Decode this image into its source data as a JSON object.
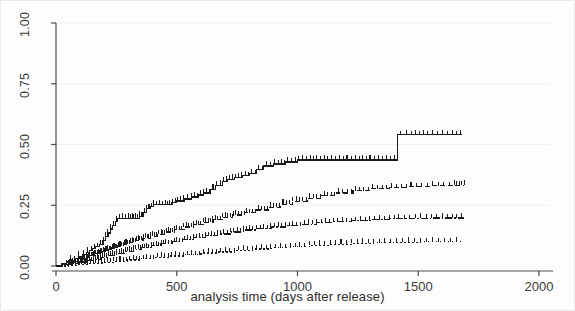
{
  "chart_data": {
    "type": "line",
    "title": "",
    "subtitle": "",
    "xlabel": "analysis time (days after release)",
    "ylabel": "",
    "xlim": [
      0,
      2000
    ],
    "ylim": [
      0.0,
      1.0
    ],
    "xticks": [
      0,
      500,
      1000,
      1500,
      2000
    ],
    "xtick_labels": [
      "0",
      "500",
      "1000",
      "1500",
      "2000"
    ],
    "yticks": [
      0.0,
      0.25,
      0.5,
      0.75,
      1.0
    ],
    "ytick_labels": [
      "0.00",
      "0.25",
      "0.50",
      "0.75",
      "1.00"
    ],
    "grid": "faint-horizontal",
    "legend": "none",
    "line_color": "#1a1a1a",
    "axis_color": "#4a4a4a",
    "grid_color": "#f2f2f2",
    "background": "#ffffff",
    "series": [
      {
        "name": "curve-1-highest",
        "style": "solid",
        "steps": [
          [
            0,
            0.0
          ],
          [
            25,
            0.008
          ],
          [
            45,
            0.016
          ],
          [
            60,
            0.024
          ],
          [
            80,
            0.032
          ],
          [
            95,
            0.04
          ],
          [
            110,
            0.048
          ],
          [
            125,
            0.056
          ],
          [
            140,
            0.064
          ],
          [
            150,
            0.072
          ],
          [
            165,
            0.08
          ],
          [
            180,
            0.088
          ],
          [
            195,
            0.104
          ],
          [
            205,
            0.12
          ],
          [
            215,
            0.136
          ],
          [
            225,
            0.152
          ],
          [
            235,
            0.168
          ],
          [
            245,
            0.184
          ],
          [
            255,
            0.196
          ],
          [
            270,
            0.196
          ],
          [
            290,
            0.196
          ],
          [
            320,
            0.196
          ],
          [
            345,
            0.204
          ],
          [
            360,
            0.22
          ],
          [
            375,
            0.236
          ],
          [
            390,
            0.244
          ],
          [
            405,
            0.252
          ],
          [
            420,
            0.252
          ],
          [
            450,
            0.252
          ],
          [
            480,
            0.26
          ],
          [
            500,
            0.268
          ],
          [
            530,
            0.276
          ],
          [
            560,
            0.284
          ],
          [
            590,
            0.292
          ],
          [
            610,
            0.3
          ],
          [
            640,
            0.316
          ],
          [
            660,
            0.332
          ],
          [
            690,
            0.348
          ],
          [
            710,
            0.356
          ],
          [
            740,
            0.364
          ],
          [
            770,
            0.372
          ],
          [
            800,
            0.38
          ],
          [
            830,
            0.396
          ],
          [
            860,
            0.412
          ],
          [
            900,
            0.42
          ],
          [
            950,
            0.428
          ],
          [
            1000,
            0.436
          ],
          [
            1060,
            0.436
          ],
          [
            1140,
            0.436
          ],
          [
            1240,
            0.436
          ],
          [
            1340,
            0.436
          ],
          [
            1400,
            0.436
          ],
          [
            1415,
            0.54
          ],
          [
            1500,
            0.54
          ],
          [
            1600,
            0.54
          ],
          [
            1680,
            0.54
          ]
        ],
        "censor_times": [
          60,
          95,
          130,
          160,
          185,
          205,
          225,
          250,
          275,
          300,
          315,
          330,
          345,
          365,
          385,
          405,
          430,
          455,
          470,
          495,
          515,
          545,
          575,
          600,
          625,
          650,
          680,
          705,
          730,
          755,
          785,
          810,
          840,
          870,
          905,
          935,
          960,
          990,
          1020,
          1055,
          1080,
          1110,
          1140,
          1175,
          1205,
          1240,
          1270,
          1300,
          1335,
          1370,
          1400,
          1450,
          1490,
          1520,
          1560,
          1600,
          1640,
          1675
        ]
      },
      {
        "name": "curve-2",
        "style": "dashed",
        "steps": [
          [
            0,
            0.0
          ],
          [
            30,
            0.006
          ],
          [
            55,
            0.012
          ],
          [
            80,
            0.018
          ],
          [
            100,
            0.026
          ],
          [
            120,
            0.034
          ],
          [
            140,
            0.042
          ],
          [
            160,
            0.05
          ],
          [
            185,
            0.058
          ],
          [
            205,
            0.066
          ],
          [
            230,
            0.074
          ],
          [
            255,
            0.082
          ],
          [
            280,
            0.09
          ],
          [
            305,
            0.098
          ],
          [
            330,
            0.106
          ],
          [
            360,
            0.114
          ],
          [
            390,
            0.122
          ],
          [
            420,
            0.13
          ],
          [
            455,
            0.14
          ],
          [
            490,
            0.15
          ],
          [
            530,
            0.16
          ],
          [
            570,
            0.17
          ],
          [
            610,
            0.18
          ],
          [
            650,
            0.19
          ],
          [
            690,
            0.2
          ],
          [
            730,
            0.21
          ],
          [
            780,
            0.22
          ],
          [
            830,
            0.23
          ],
          [
            880,
            0.242
          ],
          [
            930,
            0.254
          ],
          [
            980,
            0.266
          ],
          [
            1040,
            0.278
          ],
          [
            1100,
            0.29
          ],
          [
            1160,
            0.3
          ],
          [
            1230,
            0.31
          ],
          [
            1300,
            0.318
          ],
          [
            1380,
            0.322
          ],
          [
            1460,
            0.326
          ],
          [
            1550,
            0.33
          ],
          [
            1650,
            0.332
          ],
          [
            1690,
            0.332
          ]
        ],
        "censor_times": [
          45,
          70,
          95,
          115,
          135,
          155,
          175,
          195,
          215,
          240,
          265,
          290,
          315,
          340,
          370,
          400,
          435,
          465,
          500,
          540,
          580,
          620,
          660,
          700,
          745,
          790,
          840,
          890,
          940,
          995,
          1050,
          1110,
          1170,
          1240,
          1310,
          1390,
          1470,
          1560,
          1650,
          1690
        ]
      },
      {
        "name": "curve-3",
        "style": "dashdot",
        "steps": [
          [
            0,
            0.0
          ],
          [
            35,
            0.005
          ],
          [
            65,
            0.01
          ],
          [
            95,
            0.016
          ],
          [
            125,
            0.022
          ],
          [
            155,
            0.028
          ],
          [
            185,
            0.036
          ],
          [
            215,
            0.044
          ],
          [
            250,
            0.052
          ],
          [
            285,
            0.06
          ],
          [
            320,
            0.068
          ],
          [
            355,
            0.076
          ],
          [
            395,
            0.084
          ],
          [
            435,
            0.092
          ],
          [
            480,
            0.1
          ],
          [
            525,
            0.108
          ],
          [
            570,
            0.116
          ],
          [
            620,
            0.124
          ],
          [
            670,
            0.132
          ],
          [
            720,
            0.14
          ],
          [
            775,
            0.148
          ],
          [
            830,
            0.154
          ],
          [
            890,
            0.16
          ],
          [
            950,
            0.166
          ],
          [
            1015,
            0.172
          ],
          [
            1080,
            0.178
          ],
          [
            1150,
            0.182
          ],
          [
            1225,
            0.186
          ],
          [
            1300,
            0.19
          ],
          [
            1380,
            0.194
          ],
          [
            1470,
            0.196
          ],
          [
            1560,
            0.198
          ],
          [
            1660,
            0.198
          ],
          [
            1690,
            0.198
          ]
        ],
        "censor_times": [
          50,
          80,
          110,
          140,
          170,
          200,
          235,
          270,
          305,
          340,
          375,
          415,
          455,
          500,
          545,
          595,
          645,
          695,
          750,
          800,
          860,
          920,
          980,
          1045,
          1115,
          1185,
          1260,
          1340,
          1420,
          1510,
          1600,
          1680
        ]
      },
      {
        "name": "curve-4-lowest",
        "style": "dotted",
        "steps": [
          [
            0,
            0.0
          ],
          [
            50,
            0.003
          ],
          [
            95,
            0.007
          ],
          [
            140,
            0.011
          ],
          [
            190,
            0.015
          ],
          [
            240,
            0.02
          ],
          [
            295,
            0.025
          ],
          [
            350,
            0.03
          ],
          [
            410,
            0.035
          ],
          [
            470,
            0.041
          ],
          [
            535,
            0.047
          ],
          [
            600,
            0.053
          ],
          [
            670,
            0.058
          ],
          [
            740,
            0.064
          ],
          [
            815,
            0.07
          ],
          [
            890,
            0.075
          ],
          [
            970,
            0.08
          ],
          [
            1050,
            0.085
          ],
          [
            1135,
            0.089
          ],
          [
            1225,
            0.093
          ],
          [
            1315,
            0.096
          ],
          [
            1410,
            0.098
          ],
          [
            1510,
            0.1
          ],
          [
            1610,
            0.1
          ],
          [
            1690,
            0.1
          ]
        ],
        "censor_times": [
          70,
          120,
          165,
          215,
          265,
          320,
          375,
          435,
          495,
          560,
          630,
          700,
          775,
          850,
          930,
          1010,
          1090,
          1180,
          1270,
          1360,
          1460,
          1560,
          1660
        ]
      }
    ]
  },
  "xaxis": {
    "title": "analysis time (days after release)"
  }
}
